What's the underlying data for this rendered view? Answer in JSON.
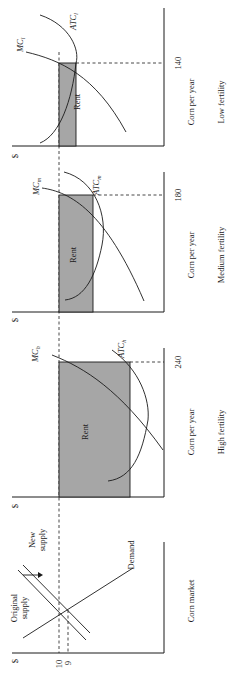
{
  "figure": {
    "orientation": "rotated 90 degrees counter-clockwise",
    "currency_symbol": "$",
    "rent_fill_color": "#a6a6a6",
    "corn_market": {
      "title": "Corn market",
      "original_supply_label": "Original supply",
      "new_supply_label": "New supply",
      "demand_label": "Demand",
      "price_original": "10",
      "price_new": "9"
    },
    "panels": [
      {
        "id": "high",
        "title": "High fertility",
        "x_label": "Corn per year",
        "quantity": "240",
        "mc_label": "MC",
        "mc_sub": "h",
        "atc_label": "ATC",
        "atc_sub": "h",
        "rent_label": "Rent"
      },
      {
        "id": "medium",
        "title": "Medium fertility",
        "x_label": "Corn per year",
        "quantity": "180",
        "mc_label": "MC",
        "mc_sub": "m",
        "atc_label": "ATC",
        "atc_sub": "m",
        "rent_label": "Rent"
      },
      {
        "id": "low",
        "title": "Low fertility",
        "x_label": "Corn per year",
        "quantity": "140",
        "mc_label": "MC",
        "mc_sub": "l",
        "atc_label": "ATC",
        "atc_sub": "l",
        "rent_label": "Rent"
      }
    ]
  }
}
